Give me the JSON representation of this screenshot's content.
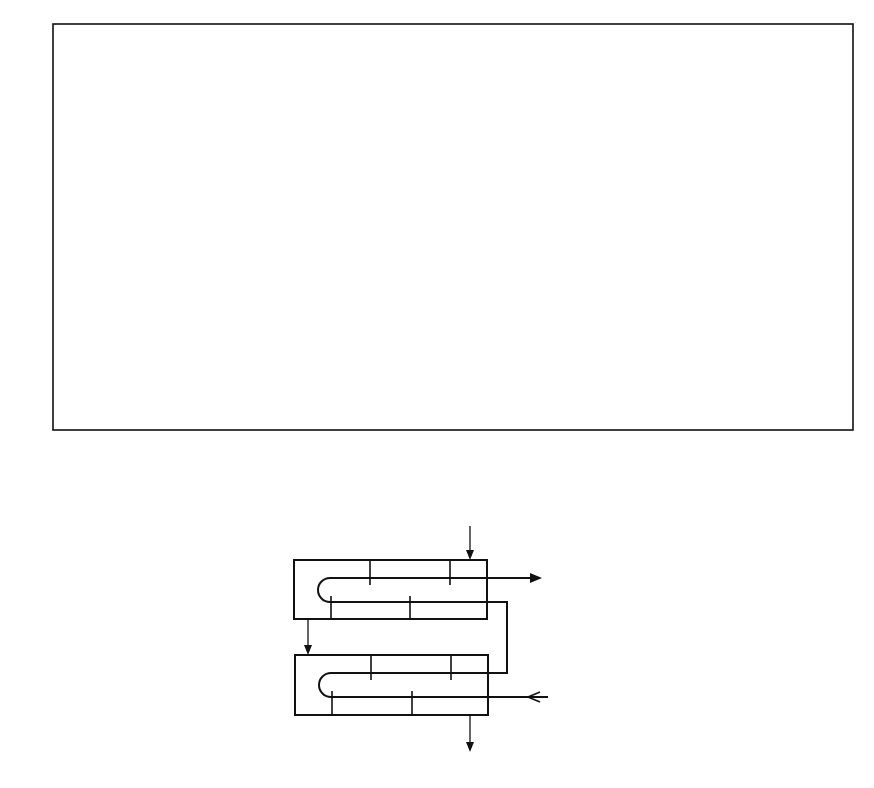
{
  "chart_data": {
    "type": "line",
    "title": "",
    "xlabel": "P=(T t out − T t in)/(T s in − T t in)",
    "ylabel": "F",
    "xlim": [
      0,
      1.0
    ],
    "ylim": [
      0.5,
      1.0
    ],
    "grid": true,
    "x_ticks": [
      "0",
      "0.1",
      "0.2",
      "0.3",
      "0.4",
      "0.5",
      "0.6",
      "0.7",
      "0.8",
      "0.9",
      "1.0"
    ],
    "y_ticks": [
      "0.5",
      "0.6",
      "0.7",
      "0.8",
      "0.9",
      "1.0"
    ],
    "series_param_name": "Z",
    "series": [
      {
        "name": "20.0",
        "Z": 20.0,
        "P_at_F_0.5": 0.054
      },
      {
        "name": "15.0",
        "Z": 15.0,
        "P_at_F_0.5": 0.071
      },
      {
        "name": "Z=10.0",
        "Z": 10.0,
        "P_at_F_0.5": 0.104
      },
      {
        "name": "8.0",
        "Z": 8.0,
        "P_at_F_0.5": 0.129
      },
      {
        "name": "6.0",
        "Z": 6.0,
        "P_at_F_0.5": 0.168
      },
      {
        "name": "4.0",
        "Z": 4.0,
        "P_at_F_0.5": 0.249
      },
      {
        "name": "3.0",
        "Z": 3.0,
        "P_at_F_0.5": 0.324
      },
      {
        "name": "2.5",
        "Z": 2.5,
        "P_at_F_0.5": 0.384
      },
      {
        "name": "2.0",
        "Z": 2.0,
        "P_at_F_0.5": 0.46
      },
      {
        "name": "1.8",
        "Z": 1.8,
        "P_at_F_0.5": 0.503
      },
      {
        "name": "1.6",
        "Z": 1.6,
        "P_at_F_0.5": 0.551
      },
      {
        "name": "1.4",
        "Z": 1.4,
        "P_at_F_0.5": 0.605
      },
      {
        "name": "1.2",
        "Z": 1.2,
        "P_at_F_0.5": 0.669
      },
      {
        "name": "1.0",
        "Z": 1.0,
        "P_at_F_0.5": 0.736
      },
      {
        "name": "0.9",
        "Z": 0.9,
        "P_at_F_0.5": 0.776
      },
      {
        "name": "0.8",
        "Z": 0.8,
        "P_at_F_0.5": 0.809
      },
      {
        "name": "0.7",
        "Z": 0.7,
        "P_at_F_0.5": 0.86
      },
      {
        "name": "0.6",
        "Z": 0.6,
        "P_at_F_0.5": 0.903
      },
      {
        "name": "0.5",
        "Z": 0.5,
        "P_at_F_0.5": 0.935
      },
      {
        "name": "0.4",
        "Z": 0.4,
        "P_at_F_0.5": 0.97
      },
      {
        "name": "0.3",
        "Z": 0.3,
        "P_at_F_0.5": 0.98
      },
      {
        "name": "0.2",
        "Z": 0.2,
        "P_at_F_0.5": 0.989
      },
      {
        "name": "0.1",
        "Z": 0.1,
        "P_at_F_0.5": 0.998
      }
    ],
    "annotations": [
      "Curves labeled by Z (capacity ratio), F = correction factor",
      "Schematic: two-shell-pass, four-tube-pass exchanger"
    ]
  },
  "axis": {
    "y_title": "F",
    "x_title_P": "P",
    "x_title_eq": "=(",
    "x_title_T": "T",
    "sub_t_out": "t out",
    "sub_t_in": "t in",
    "sub_s_in": "s in",
    "minus": "−",
    "slash": ")/(",
    "close": ")"
  },
  "diagram": {
    "label_T": "T",
    "t_s_in": "s in",
    "t_t_out": "t out",
    "t_t_in": "t in",
    "t_s_out": "s out"
  }
}
